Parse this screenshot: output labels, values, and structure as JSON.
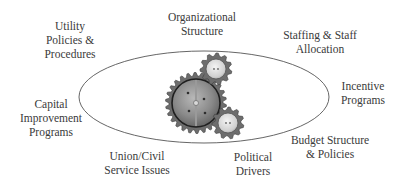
{
  "diagram": {
    "type": "factors-around-gears",
    "center_graphic": "interlocking-gears",
    "ellipse": {
      "cx": 204,
      "cy": 97,
      "rx": 125,
      "ry": 46,
      "stroke": "#555555"
    },
    "gears": [
      {
        "name": "large-gear",
        "cx": 196,
        "cy": 103,
        "r": 27
      },
      {
        "name": "top-small-gear",
        "cx": 216,
        "cy": 69,
        "r": 13
      },
      {
        "name": "bottom-small-gear",
        "cx": 228,
        "cy": 123,
        "r": 13
      }
    ],
    "labels": [
      {
        "id": "utility-policies",
        "lines": [
          "Utility",
          "Policies &",
          "Procedures"
        ],
        "x": 70,
        "y": 19
      },
      {
        "id": "organizational-structure",
        "lines": [
          "Organizational",
          "Structure"
        ],
        "x": 202,
        "y": 10
      },
      {
        "id": "staffing-allocation",
        "lines": [
          "Staffing & Staff",
          "Allocation"
        ],
        "x": 320,
        "y": 28
      },
      {
        "id": "incentive-programs",
        "lines": [
          "Incentive",
          "Programs"
        ],
        "x": 363,
        "y": 79
      },
      {
        "id": "capital-improvement",
        "lines": [
          "Capital",
          "Improvement",
          "Programs"
        ],
        "x": 51,
        "y": 97
      },
      {
        "id": "budget-structure",
        "lines": [
          "Budget Structure",
          "& Policies"
        ],
        "x": 330,
        "y": 133
      },
      {
        "id": "union-civil-service",
        "lines": [
          "Union/Civil",
          "Service Issues"
        ],
        "x": 137,
        "y": 149
      },
      {
        "id": "political-drivers",
        "lines": [
          "Political",
          "Drivers"
        ],
        "x": 253,
        "y": 150
      }
    ]
  }
}
